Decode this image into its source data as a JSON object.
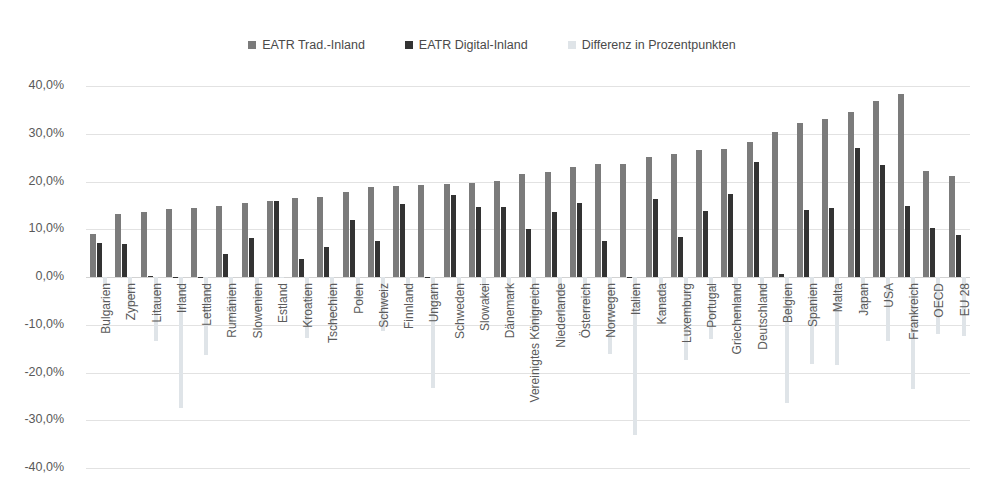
{
  "legend": {
    "items": [
      {
        "label": "EATR Trad.-Inland",
        "color": "#7b7b7b",
        "key": "trad"
      },
      {
        "label": "EATR Digital-Inland",
        "color": "#333333",
        "key": "digital"
      },
      {
        "label": "Differenz in Prozentpunkten",
        "color": "#dfe4e8",
        "key": "diff"
      }
    ]
  },
  "axis": {
    "y_ticks": [
      "40,0%",
      "30,0%",
      "20,0%",
      "10,0%",
      "0,0%",
      "-10,0%",
      "-20,0%",
      "-30,0%",
      "-40,0%"
    ],
    "y_values": [
      40,
      30,
      20,
      10,
      0,
      -10,
      -20,
      -30,
      -40
    ]
  },
  "chart_data": {
    "type": "bar",
    "title": "",
    "xlabel": "",
    "ylabel": "",
    "ylim": [
      -40,
      40
    ],
    "grid": true,
    "legend_position": "top-center",
    "categories": [
      "Bulgarien",
      "Zypern",
      "Litauen",
      "Irland",
      "Lettland",
      "Rumänien",
      "Slowenien",
      "Estland",
      "Kroatien",
      "Tschechien",
      "Polen",
      "Schweiz",
      "Finnland",
      "Ungarn",
      "Schweden",
      "Slowakei",
      "Dänemark",
      "Vereinigtes Königreich",
      "Niederlande",
      "Österreich",
      "Norwegen",
      "Italien",
      "Kanada",
      "Luxemburg",
      "Portugal",
      "Griechenland",
      "Deutschland",
      "Belgien",
      "Spanien",
      "Malta",
      "Japan",
      "USA",
      "Frankreich",
      "OECD",
      "EU 28"
    ],
    "series": [
      {
        "name": "EATR Trad.-Inland",
        "color": "#7b7b7b",
        "values": [
          9.0,
          13.1,
          13.7,
          14.3,
          14.4,
          14.8,
          15.5,
          16.0,
          16.5,
          16.7,
          17.9,
          18.9,
          19.0,
          19.2,
          19.4,
          19.6,
          20.2,
          21.6,
          22.0,
          23.1,
          23.6,
          23.7,
          25.1,
          25.7,
          26.7,
          26.9,
          28.2,
          30.4,
          32.3,
          33.0,
          34.5,
          36.9,
          38.4,
          22.2,
          21.2
        ]
      },
      {
        "name": "EATR Digital-Inland",
        "color": "#333333",
        "values": [
          7.1,
          6.9,
          0.2,
          -0.1,
          0.1,
          4.9,
          8.1,
          15.9,
          3.7,
          6.2,
          11.9,
          7.6,
          15.3,
          0.0,
          17.1,
          14.7,
          14.7,
          10.1,
          13.6,
          15.5,
          7.5,
          0.0,
          16.3,
          8.3,
          13.8,
          17.3,
          24.0,
          0.6,
          14.0,
          14.5,
          27.0,
          23.5,
          14.9,
          10.2,
          8.8
        ]
      },
      {
        "name": "Differenz in Prozentpunkten",
        "color": "#dfe4e8",
        "values": [
          -1.9,
          -6.2,
          -13.5,
          -27.4,
          -16.4,
          -9.9,
          -7.4,
          -0.1,
          -12.8,
          -10.5,
          -6.0,
          -11.3,
          -3.7,
          -23.3,
          -2.3,
          -4.9,
          -5.5,
          -11.5,
          -8.4,
          -7.6,
          -16.1,
          -33.0,
          -8.8,
          -17.4,
          -12.9,
          -9.6,
          -4.2,
          -26.4,
          -18.3,
          -18.5,
          -7.5,
          -13.4,
          -23.5,
          -12.0,
          -12.4
        ]
      }
    ]
  }
}
